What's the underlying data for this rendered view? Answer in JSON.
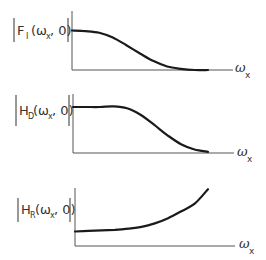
{
  "panels": [
    {
      "name": "F_I",
      "label_main": "F",
      "label_sub": "I",
      "label_args": "(ω",
      "label_args_sub": "x",
      "label_tail": ", 0)",
      "x_axis_label": "ω",
      "x_axis_label_sub": "x",
      "description": "lowpass rolloff to zero"
    },
    {
      "name": "H_D",
      "label_main": "H",
      "label_sub": "D",
      "label_args": "(ω",
      "label_args_sub": "x",
      "label_tail": ", 0)",
      "x_axis_label": "ω",
      "x_axis_label_sub": "x",
      "description": "flat then rolloff to zero"
    },
    {
      "name": "H_R",
      "label_main": "H",
      "label_sub": "R",
      "label_args": "(ω",
      "label_args_sub": "x",
      "label_tail": ", 0)",
      "x_axis_label": "ω",
      "x_axis_label_sub": "x",
      "description": "low then rising"
    }
  ],
  "chart_data": [
    {
      "type": "line",
      "title": "|F_I(ω_x, 0)|",
      "xlabel": "ω_x",
      "ylabel": "|F_I(ω_x, 0)|",
      "x": [
        0,
        0.1,
        0.2,
        0.3,
        0.4,
        0.5,
        0.6,
        0.7,
        0.8,
        0.9,
        1.0
      ],
      "values": [
        0.67,
        0.66,
        0.63,
        0.55,
        0.42,
        0.28,
        0.15,
        0.06,
        0.02,
        0.0,
        0.0
      ],
      "xlim": [
        0,
        1.1
      ],
      "ylim": [
        0,
        1
      ],
      "grid": false
    },
    {
      "type": "line",
      "title": "|H_D(ω_x, 0)|",
      "xlabel": "ω_x",
      "ylabel": "|H_D(ω_x, 0)|",
      "x": [
        0,
        0.1,
        0.2,
        0.3,
        0.4,
        0.5,
        0.6,
        0.7,
        0.8,
        0.9,
        1.0
      ],
      "values": [
        0.78,
        0.78,
        0.78,
        0.79,
        0.76,
        0.65,
        0.48,
        0.3,
        0.15,
        0.06,
        0.02
      ],
      "xlim": [
        0,
        1.1
      ],
      "ylim": [
        0,
        1
      ],
      "grid": false
    },
    {
      "type": "line",
      "title": "|H_R(ω_x, 0)|",
      "xlabel": "ω_x",
      "ylabel": "|H_R(ω_x, 0)|",
      "x": [
        0,
        0.1,
        0.2,
        0.3,
        0.4,
        0.5,
        0.6,
        0.7,
        0.8,
        0.9,
        1.0
      ],
      "values": [
        0.25,
        0.26,
        0.27,
        0.28,
        0.3,
        0.33,
        0.39,
        0.48,
        0.6,
        0.73,
        0.98
      ],
      "xlim": [
        0,
        1.1
      ],
      "ylim": [
        0,
        1
      ],
      "grid": false
    }
  ]
}
